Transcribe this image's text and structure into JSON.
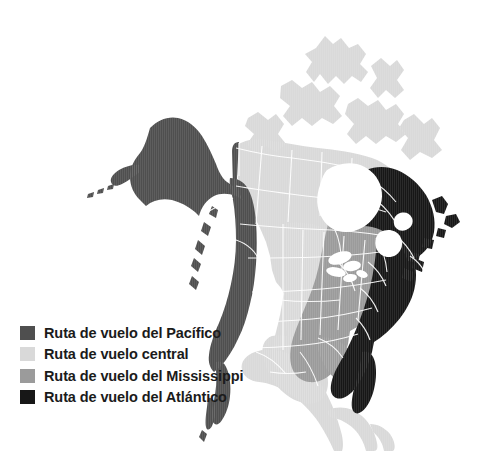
{
  "figure": {
    "kind": "thematic-map",
    "region": "América del Norte"
  },
  "colors": {
    "background": "#ffffff",
    "water": "#ffffff",
    "pacific": "#4f4f4f",
    "central": "#d9d9d9",
    "mississippi": "#9b9b9b",
    "atlantic": "#171717",
    "border_line": "#ffffff",
    "label_text": "#1b1b1b",
    "top_band": "#ececec"
  },
  "legend": {
    "items": [
      {
        "swatch": "pacific",
        "swatch_color": "#4f4f4f",
        "label": "Ruta de vuelo del Pacífico"
      },
      {
        "swatch": "central",
        "swatch_color": "#d9d9d9",
        "label": "Ruta de vuelo central"
      },
      {
        "swatch": "mississippi",
        "swatch_color": "#9b9b9b",
        "label": "Ruta de vuelo del Mississippi"
      },
      {
        "swatch": "atlantic",
        "swatch_color": "#171717",
        "label": "Ruta de vuelo del Atlántico"
      }
    ]
  },
  "map_regions": [
    {
      "name": "Ruta de vuelo del Pacífico",
      "fill": "#4f4f4f",
      "covers": "Alaska, Yukón, Columbia Británica, costa oeste de EE. UU., Baja California"
    },
    {
      "name": "Ruta de vuelo central",
      "fill": "#d9d9d9",
      "covers": "Territorios del Noroeste, Nunavut, praderas canadienses, Grandes Llanuras, México, América Central"
    },
    {
      "name": "Ruta de vuelo del Mississippi",
      "fill": "#9b9b9b",
      "covers": "Ontario, región de los Grandes Lagos, valle del Mississippi, Costa del Golfo"
    },
    {
      "name": "Ruta de vuelo del Atlántico",
      "fill": "#171717",
      "covers": "Quebec, Labrador, Terranova, Marítimas, costa este de EE. UU., Florida"
    }
  ]
}
